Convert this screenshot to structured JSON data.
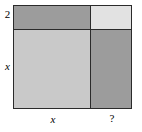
{
  "diagram": {
    "type": "area-model",
    "labels": {
      "top_row_height": "2",
      "bottom_row_height": "x",
      "left_column_width": "x",
      "right_column_width": "?"
    },
    "cells": [
      {
        "name": "top-left",
        "fill": "#9c9c9c"
      },
      {
        "name": "top-right",
        "fill": "#e2e2e2"
      },
      {
        "name": "bottom-left",
        "fill": "#c9c9c9"
      },
      {
        "name": "bottom-right",
        "fill": "#9c9c9c"
      }
    ],
    "colors": {
      "stroke": "#2b2b2b",
      "background": "#ffffff",
      "text": "#000000"
    }
  }
}
